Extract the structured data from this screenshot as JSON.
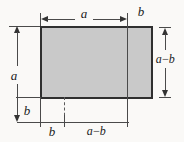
{
  "labels": {
    "top_width": "a",
    "top_right_width": "b",
    "left_height": "a",
    "left_lower_height": "b",
    "right_height": "a−b",
    "bottom_left_width": "b",
    "bottom_right_width": "a−b"
  },
  "colors": {
    "background": "#faf9f7",
    "rectangle_fill": "#c9c9c9",
    "rectangle_border": "#2f2f2f",
    "line": "#4a4a4a",
    "label_text": "#1b1b1b"
  }
}
